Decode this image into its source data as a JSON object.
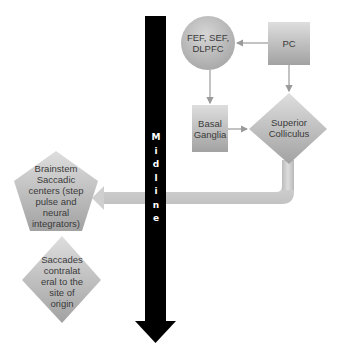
{
  "diagram": {
    "midline": {
      "label": "Midline",
      "letters": [
        "M",
        "i",
        "d",
        "l",
        "i",
        "n",
        "e"
      ],
      "color": "#000000",
      "direction": "down"
    },
    "nodes": {
      "fef": {
        "label": "FEF, SEF, DLPFC",
        "shape": "circle"
      },
      "pc": {
        "label": "PC",
        "shape": "square"
      },
      "basal_ganglia": {
        "label": "Basal Ganglia",
        "line1": "Basal",
        "line2": "Ganglia",
        "shape": "rectangle"
      },
      "superior_colliculus": {
        "label": "Superior Colliculus",
        "line1": "Superior",
        "line2": "Colliculus",
        "shape": "diamond"
      },
      "brainstem": {
        "label": "Brainstem Saccadic centers (step pulse and neural integrators)",
        "lines": [
          "Brainstem",
          "Saccadic",
          "centers (step",
          "pulse and",
          "neural",
          "integrators)"
        ],
        "shape": "pentagon"
      },
      "saccades": {
        "label": "Saccades contralateral to the site of origin",
        "lines": [
          "Saccades",
          "contralat",
          "eral to the",
          "site of",
          "origin"
        ],
        "shape": "diamond"
      }
    },
    "edges": [
      {
        "from": "PC",
        "to": "FEF, SEF, DLPFC"
      },
      {
        "from": "PC",
        "to": "Superior Colliculus"
      },
      {
        "from": "FEF, SEF, DLPFC",
        "to": "Basal Ganglia"
      },
      {
        "from": "Basal Ganglia",
        "to": "Superior Colliculus"
      },
      {
        "from": "Superior Colliculus",
        "to": "Brainstem Saccadic centers",
        "style": "thick crossing midline"
      }
    ],
    "colors": {
      "node_fill_light": "#dcdcdc",
      "node_fill_dark": "#a4a4a4",
      "connector": "#c8c8c8",
      "text": "#3a3a3a"
    }
  }
}
